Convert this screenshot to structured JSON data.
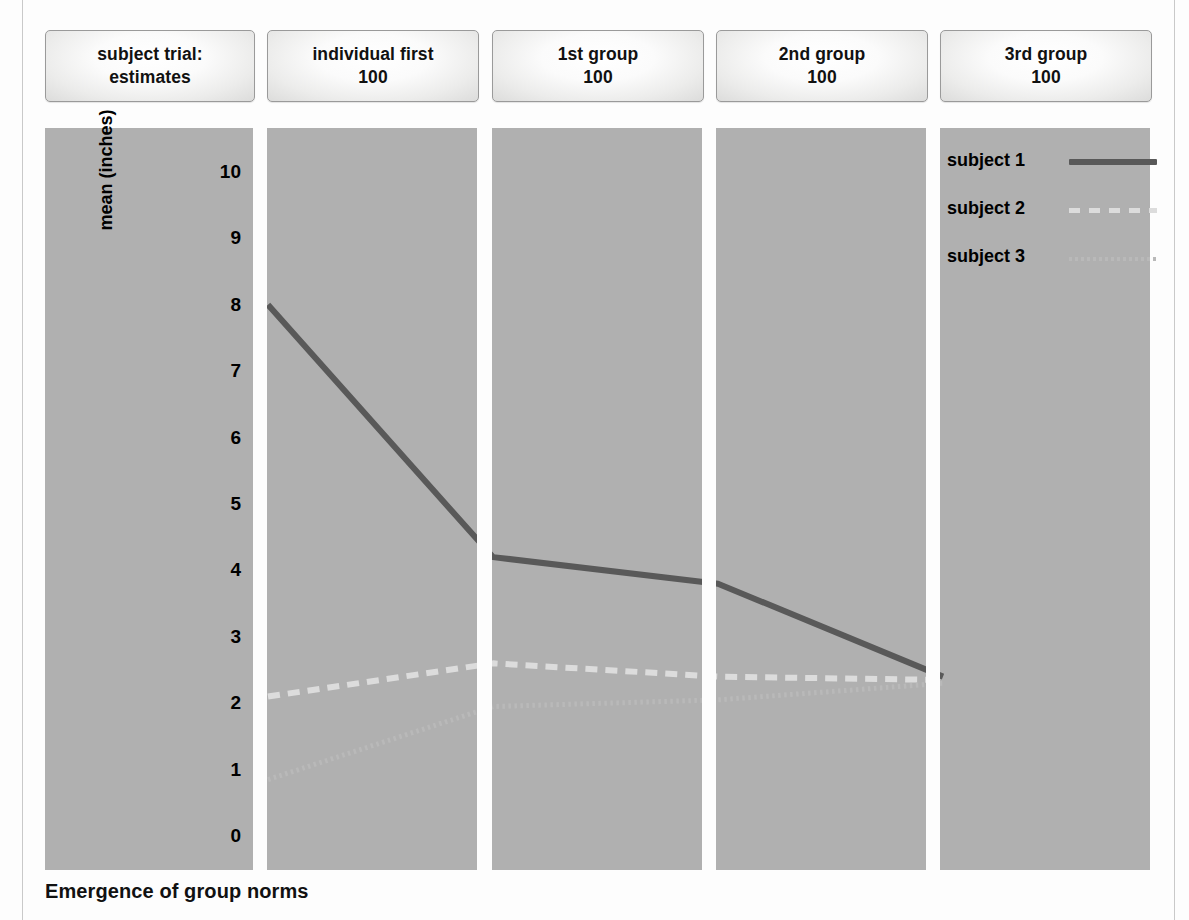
{
  "figure": {
    "caption": "Emergence of group norms",
    "background": "#fdfdfd",
    "panel_color": "#b0b0b0"
  },
  "headers": [
    {
      "line1": "subject trial:",
      "line2": "estimates"
    },
    {
      "line1": "individual first",
      "line2": "100"
    },
    {
      "line1": "1st group",
      "line2": "100"
    },
    {
      "line1": "2nd group",
      "line2": "100"
    },
    {
      "line1": "3rd group",
      "line2": "100"
    }
  ],
  "legend": {
    "position": "top-right",
    "entries": [
      {
        "label": "subject 1",
        "style": "solid",
        "color": "#595959"
      },
      {
        "label": "subject 2",
        "style": "dashed",
        "color": "#dcdcdc"
      },
      {
        "label": "subject 3",
        "style": "dotted",
        "color": "#b9b9b9"
      }
    ]
  },
  "axis": {
    "ylabel": "mean (inches)",
    "yticks": [
      "10",
      "9",
      "8",
      "7",
      "6",
      "5",
      "4",
      "3",
      "2",
      "1",
      "0"
    ]
  },
  "chart_data": {
    "type": "line",
    "title": "Emergence of group norms",
    "xlabel": "",
    "ylabel": "mean (inches)",
    "categories": [
      "individual first",
      "1st group",
      "2nd group",
      "3rd group"
    ],
    "ylim": [
      0,
      10
    ],
    "ytick_values": [
      0,
      1,
      2,
      3,
      4,
      5,
      6,
      7,
      8,
      9,
      10
    ],
    "grid": false,
    "legend_position": "top-right",
    "series": [
      {
        "name": "subject 1",
        "style": "solid",
        "color": "#595959",
        "values": [
          8.0,
          4.2,
          3.8,
          2.4
        ]
      },
      {
        "name": "subject 2",
        "style": "dashed",
        "color": "#dcdcdc",
        "values": [
          2.1,
          2.6,
          2.4,
          2.35
        ]
      },
      {
        "name": "subject 3",
        "style": "dotted",
        "color": "#b9b9b9",
        "values": [
          0.85,
          1.95,
          2.05,
          2.3
        ]
      }
    ]
  }
}
